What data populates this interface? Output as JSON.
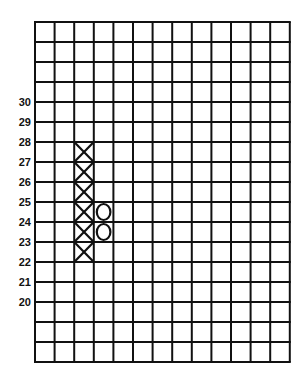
{
  "chart_data": {
    "type": "point-and-figure",
    "title": "",
    "xlabel": "",
    "ylabel": "",
    "box_size": 1,
    "grid": {
      "on": true,
      "columns": 13,
      "rows": 17,
      "left": 35,
      "top": 22,
      "cell_width": 19.6,
      "cell_height": 20,
      "line_color": "#111111"
    },
    "y_tick_labels": [
      "30",
      "29",
      "28",
      "27",
      "26",
      "25",
      "24",
      "23",
      "22",
      "21",
      "20"
    ],
    "y_tick_values": [
      30,
      29,
      28,
      27,
      26,
      25,
      24,
      23,
      22,
      21,
      20
    ],
    "ylim_visible_labels": [
      20,
      30
    ],
    "top_label_row": 4,
    "series": [
      {
        "name": "X column",
        "symbol": "X",
        "column_index": 2,
        "boxes": [
          {
            "from": 27,
            "to": 28
          },
          {
            "from": 26,
            "to": 27
          },
          {
            "from": 25,
            "to": 26
          },
          {
            "from": 24,
            "to": 25
          },
          {
            "from": 23,
            "to": 24
          },
          {
            "from": 22,
            "to": 23
          }
        ],
        "low": 22,
        "high": 28
      },
      {
        "name": "O column",
        "symbol": "O",
        "column_index": 3,
        "boxes": [
          {
            "from": 24,
            "to": 25
          },
          {
            "from": 23,
            "to": 24
          }
        ],
        "low": 23,
        "high": 25
      }
    ]
  }
}
